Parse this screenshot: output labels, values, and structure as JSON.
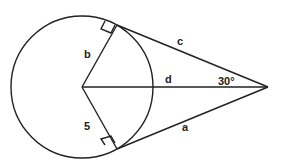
{
  "diagram": {
    "type": "geometry-circle-tangents",
    "labels": {
      "b": "b",
      "c": "c",
      "d": "d",
      "a": "a",
      "radius_value": "5",
      "angle": "30°"
    },
    "colors": {
      "stroke": "#222222",
      "background": "#ffffff"
    }
  }
}
